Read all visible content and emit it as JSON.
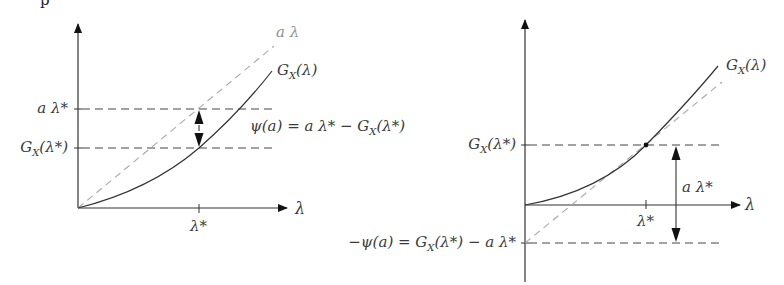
{
  "figure": {
    "clipped_top_glyph": "p",
    "left_panel": {
      "x_axis_label": "λ",
      "x_tick_label": "λ*",
      "y_tick_labels": [
        "a λ*",
        "G_X(λ*)"
      ],
      "y_tick_a_lambda_star": "a λ*",
      "y_tick_g_lambda_star": "G",
      "y_tick_g_lambda_star_sub": "X",
      "y_tick_g_lambda_star_arg": "(λ*)",
      "line_label": "a λ",
      "curve_label_main": "G",
      "curve_label_sub": "X",
      "curve_label_arg": "(λ)",
      "annotation": "ψ(a) = a λ* − G",
      "annotation_sub": "X",
      "annotation_arg": "(λ*)"
    },
    "right_panel": {
      "x_axis_label": "λ",
      "x_tick_label": "λ*",
      "y_tick_upper_main": "G",
      "y_tick_upper_sub": "X",
      "y_tick_upper_arg": "(λ*)",
      "y_tick_lower": "−ψ(a) = G",
      "y_tick_lower_sub": "X",
      "y_tick_lower_arg": "(λ*) − a λ*",
      "arrow_label": "a λ*",
      "curve_label_main": "G",
      "curve_label_sub": "X",
      "curve_label_arg": "(λ)"
    },
    "colors": {
      "curve": "#333333",
      "axis": "#333333",
      "dashed_guide": "#444444",
      "tangent_line": "#a8a8a8"
    }
  }
}
